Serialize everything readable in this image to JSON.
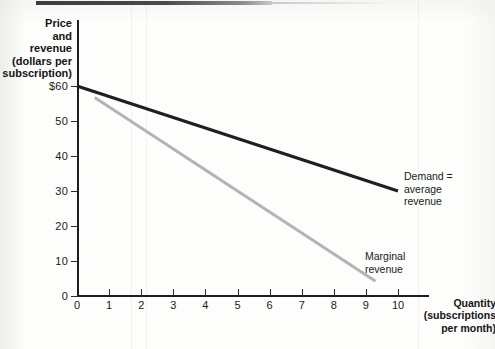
{
  "figure": {
    "background_color": "#fdfdfc",
    "axis_color": "#1d1d1d"
  },
  "chart_data": {
    "type": "line",
    "title": "",
    "subtitle": "",
    "xlabel": "Quantity (subscriptions per month)",
    "ylabel": "Price and revenue (dollars per subscription)",
    "xlabel_lines": [
      "Quantity",
      "(subscriptions",
      "per month)"
    ],
    "ylabel_lines": [
      "Price",
      "and",
      "revenue",
      "(dollars per",
      "subscription)"
    ],
    "xlim": [
      0,
      11
    ],
    "ylim": [
      0,
      62
    ],
    "xticks": [
      0,
      1,
      2,
      3,
      4,
      5,
      6,
      7,
      8,
      9,
      10
    ],
    "xtick_labels": [
      "0",
      "1",
      "2",
      "3",
      "4",
      "5",
      "6",
      "7",
      "8",
      "9",
      "10"
    ],
    "yticks": [
      0,
      10,
      20,
      30,
      40,
      50,
      60
    ],
    "ytick_labels": [
      "0",
      "10",
      "20",
      "30",
      "40",
      "50",
      "$60"
    ],
    "grid": false,
    "legend_position": "inline-annotations",
    "series": [
      {
        "name": "Demand = average revenue",
        "label_lines": [
          "Demand =",
          "average",
          "revenue"
        ],
        "color": "#1f1f1f",
        "width": 3.2,
        "x": [
          0,
          10
        ],
        "values": [
          60,
          30
        ],
        "slope": -3,
        "intercept": 60
      },
      {
        "name": "Marginal revenue",
        "label_lines": [
          "Marginal",
          "revenue"
        ],
        "color": "#b4b4b4",
        "width": 3.0,
        "x": [
          0.55,
          9.3
        ],
        "values": [
          56.7,
          4.2
        ],
        "slope": -6,
        "intercept": 60
      }
    ]
  },
  "artifacts": {
    "top_scan_bar": "dark horizontal scan edge",
    "seams": "faint vertical scan seams"
  }
}
